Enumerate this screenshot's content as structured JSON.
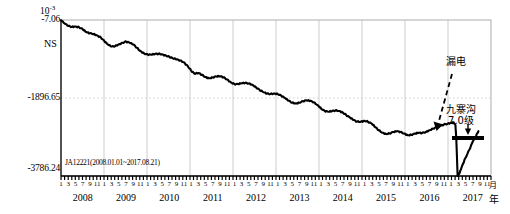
{
  "figure": {
    "station_label": "JA12221(2008.01.01~2017.08.21)",
    "component_label": "NS",
    "exponent_base": "10",
    "exponent_power": "-3",
    "unit_month": "月",
    "unit_year": "年"
  },
  "annotations": {
    "leakage": "漏电",
    "earthquake_name": "九寨沟",
    "earthquake_magnitude": "7.0级"
  },
  "chart_data": {
    "type": "line",
    "title": "",
    "subtitle": "JA12221(2008.01.01~2017.08.21)",
    "xlabel": "年",
    "ylabel": "",
    "y_exponent": "10^-3",
    "ylim": [
      -3786.24,
      -7.06
    ],
    "ytick_values": [
      -7.06,
      -1896.65,
      -3786.24
    ],
    "ytick_labels": [
      "-7.06",
      "-1896.65",
      "-3786.24"
    ],
    "xlim": [
      "2008-01",
      "2017-11"
    ],
    "grid": "vertical year lines plus one dotted horizontal midline",
    "legend": "none",
    "series_name": "NS",
    "month_ticks": [
      1,
      3,
      5,
      7,
      9,
      11
    ],
    "year_ticks": [
      "2008",
      "2009",
      "2010",
      "2011",
      "2012",
      "2013",
      "2014",
      "2015",
      "2016",
      "2017"
    ],
    "annotations": [
      {
        "text": "漏电",
        "type": "leakage-event",
        "points_to": "2017-02"
      },
      {
        "text": "九寨沟 7.0级",
        "type": "earthquake",
        "date": "2017-08-08",
        "magnitude": 7.0
      }
    ],
    "x": [
      2008.0,
      2008.08,
      2008.17,
      2008.25,
      2008.33,
      2008.42,
      2008.5,
      2008.58,
      2008.67,
      2008.75,
      2008.83,
      2008.92,
      2009.0,
      2009.08,
      2009.17,
      2009.25,
      2009.33,
      2009.42,
      2009.5,
      2009.58,
      2009.67,
      2009.75,
      2009.83,
      2009.92,
      2010.0,
      2010.08,
      2010.17,
      2010.25,
      2010.33,
      2010.42,
      2010.5,
      2010.58,
      2010.67,
      2010.75,
      2010.83,
      2010.92,
      2011.0,
      2011.08,
      2011.17,
      2011.25,
      2011.33,
      2011.42,
      2011.5,
      2011.58,
      2011.67,
      2011.75,
      2011.83,
      2011.92,
      2012.0,
      2012.08,
      2012.17,
      2012.25,
      2012.33,
      2012.42,
      2012.5,
      2012.58,
      2012.67,
      2012.75,
      2012.83,
      2012.92,
      2013.0,
      2013.08,
      2013.17,
      2013.25,
      2013.33,
      2013.42,
      2013.5,
      2013.58,
      2013.67,
      2013.75,
      2013.83,
      2013.92,
      2014.0,
      2014.08,
      2014.17,
      2014.25,
      2014.33,
      2014.42,
      2014.5,
      2014.58,
      2014.67,
      2014.75,
      2014.83,
      2014.92,
      2015.0,
      2015.08,
      2015.17,
      2015.25,
      2015.33,
      2015.42,
      2015.5,
      2015.58,
      2015.67,
      2015.75,
      2015.83,
      2015.92,
      2016.0,
      2016.08,
      2016.17,
      2016.25,
      2016.33,
      2016.42,
      2016.5,
      2016.58,
      2016.67,
      2016.75,
      2016.83,
      2016.92,
      2017.0,
      2017.06,
      2017.1,
      2017.12,
      2017.15,
      2017.2,
      2017.25,
      2017.33,
      2017.42,
      2017.5,
      2017.58,
      2017.63
    ],
    "values": [
      -7,
      -90,
      -150,
      -175,
      -165,
      -185,
      -230,
      -300,
      -330,
      -345,
      -380,
      -430,
      -520,
      -600,
      -650,
      -640,
      -600,
      -560,
      -530,
      -555,
      -600,
      -680,
      -760,
      -820,
      -845,
      -845,
      -830,
      -825,
      -840,
      -870,
      -900,
      -935,
      -960,
      -990,
      -1030,
      -1120,
      -1230,
      -1310,
      -1290,
      -1335,
      -1390,
      -1420,
      -1400,
      -1375,
      -1370,
      -1395,
      -1450,
      -1520,
      -1560,
      -1560,
      -1540,
      -1530,
      -1545,
      -1580,
      -1640,
      -1700,
      -1755,
      -1790,
      -1800,
      -1790,
      -1800,
      -1840,
      -1900,
      -1960,
      -2010,
      -2030,
      -2010,
      -1975,
      -1955,
      -1965,
      -2000,
      -2070,
      -2150,
      -2210,
      -2230,
      -2215,
      -2200,
      -2210,
      -2250,
      -2310,
      -2375,
      -2430,
      -2470,
      -2470,
      -2450,
      -2470,
      -2520,
      -2600,
      -2680,
      -2740,
      -2770,
      -2755,
      -2720,
      -2700,
      -2720,
      -2760,
      -2800,
      -2790,
      -2760,
      -2740,
      -2745,
      -2720,
      -2680,
      -2640,
      -2600,
      -2570,
      -2540,
      -2520,
      -2500,
      -2490,
      -2560,
      -2900,
      -3786,
      -3700,
      -3550,
      -3350,
      -3150,
      -2950,
      -2800,
      -2700
    ]
  }
}
